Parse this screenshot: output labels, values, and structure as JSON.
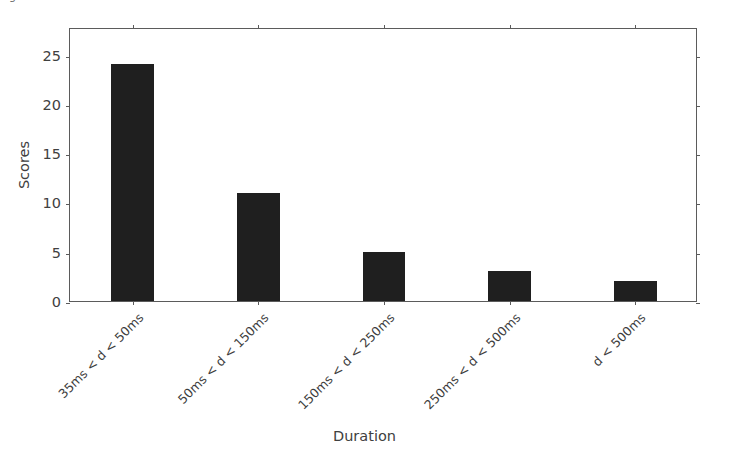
{
  "figure": {
    "width": 729,
    "height": 466,
    "background": "#ffffff",
    "cropped_caption_remnant": "Figure"
  },
  "chart_data": {
    "type": "bar",
    "title": "",
    "xlabel": "Duration",
    "ylabel": "Scores",
    "categories": [
      "35ms < d < 50ms",
      "50ms < d < 150ms",
      "150ms < d < 250ms",
      "250ms < d < 500ms",
      "d < 500ms"
    ],
    "values": [
      24,
      11,
      5,
      3,
      2
    ],
    "ylim": [
      0,
      27.8
    ],
    "xlim": [
      0,
      5
    ],
    "yticks": [
      0,
      5,
      10,
      15,
      20,
      25
    ],
    "ytick_labels": [
      "0",
      "5",
      "10",
      "15",
      "20",
      "25"
    ],
    "grid": false,
    "legend": null,
    "bar_color": "#1f1f1f",
    "axis_color": "#5b5b5b",
    "tick_label_rotation": 45,
    "bar_width_fraction": 0.34
  }
}
